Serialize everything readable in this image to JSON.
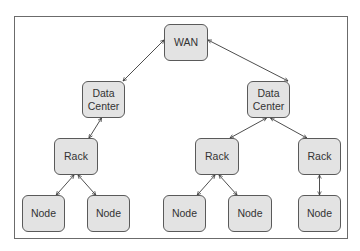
{
  "diagram": {
    "type": "network-hierarchy",
    "nodes": [
      {
        "id": "wan",
        "label": "WAN",
        "x": 164,
        "y": 24,
        "w": 44,
        "h": 37
      },
      {
        "id": "dc1",
        "label": "Data\nCenter",
        "x": 82,
        "y": 81,
        "w": 43,
        "h": 37
      },
      {
        "id": "dc2",
        "label": "Data\nCenter",
        "x": 247,
        "y": 81,
        "w": 43,
        "h": 37
      },
      {
        "id": "rack1",
        "label": "Rack",
        "x": 54,
        "y": 138,
        "w": 44,
        "h": 37
      },
      {
        "id": "rack2",
        "label": "Rack",
        "x": 195,
        "y": 138,
        "w": 44,
        "h": 37
      },
      {
        "id": "rack3",
        "label": "Rack",
        "x": 298,
        "y": 138,
        "w": 43,
        "h": 37
      },
      {
        "id": "node1",
        "label": "Node",
        "x": 22,
        "y": 195,
        "w": 43,
        "h": 37
      },
      {
        "id": "node2",
        "label": "Node",
        "x": 87,
        "y": 195,
        "w": 43,
        "h": 37
      },
      {
        "id": "node3",
        "label": "Node",
        "x": 163,
        "y": 195,
        "w": 43,
        "h": 37
      },
      {
        "id": "node4",
        "label": "Node",
        "x": 228,
        "y": 195,
        "w": 44,
        "h": 37
      },
      {
        "id": "node5",
        "label": "Node",
        "x": 298,
        "y": 195,
        "w": 43,
        "h": 37
      }
    ],
    "edges": [
      {
        "from": "wan",
        "to": "dc1",
        "bidirectional": true
      },
      {
        "from": "wan",
        "to": "dc2",
        "bidirectional": true
      },
      {
        "from": "dc1",
        "to": "rack1",
        "bidirectional": true
      },
      {
        "from": "dc2",
        "to": "rack2",
        "bidirectional": true
      },
      {
        "from": "dc2",
        "to": "rack3",
        "bidirectional": true
      },
      {
        "from": "rack1",
        "to": "node1",
        "bidirectional": true
      },
      {
        "from": "rack1",
        "to": "node2",
        "bidirectional": true
      },
      {
        "from": "rack2",
        "to": "node3",
        "bidirectional": true
      },
      {
        "from": "rack2",
        "to": "node4",
        "bidirectional": true
      },
      {
        "from": "rack3",
        "to": "node5",
        "bidirectional": true
      }
    ]
  },
  "labels": {
    "wan": "WAN",
    "dc1": "Data\nCenter",
    "dc2": "Data\nCenter",
    "rack1": "Rack",
    "rack2": "Rack",
    "rack3": "Rack",
    "node1": "Node",
    "node2": "Node",
    "node3": "Node",
    "node4": "Node",
    "node5": "Node"
  },
  "colors": {
    "box_fill": "#e3e3e3",
    "box_border": "#5a5a5a",
    "edge": "#3a3a3a",
    "frame": "#6b6b6b"
  }
}
